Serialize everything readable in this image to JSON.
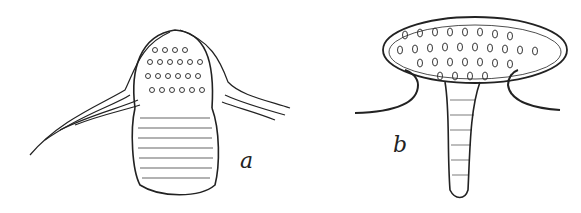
{
  "figures": [
    {
      "id": "a",
      "label": "a",
      "description": "Elongated rounded body with dotted cap, surrounded by fibrous strands"
    },
    {
      "id": "b",
      "label": "b",
      "description": "Oval cup with dotted surface atop a tapering stalk, flanked by curved membranes"
    }
  ],
  "colors": {
    "ink": "#222222",
    "background": "#ffffff"
  }
}
